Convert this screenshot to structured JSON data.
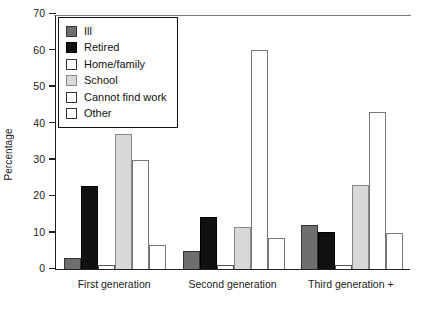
{
  "chart_data": {
    "type": "bar",
    "title": "",
    "xlabel": "",
    "ylabel": "Percentage",
    "ylim": [
      0,
      70
    ],
    "yticks": [
      0,
      10,
      20,
      30,
      40,
      50,
      60,
      70
    ],
    "ytick_labels": [
      "0",
      "10",
      "20",
      "30",
      "40",
      "50",
      "60",
      "70"
    ],
    "grid": false,
    "legend_position": "upper-left-inside",
    "categories": [
      "First generation",
      "Second generation",
      "Third generation +"
    ],
    "series": [
      {
        "name": "Ill",
        "color": "#6e6e6e",
        "edge": "#333333",
        "values": [
          3.0,
          5.0,
          12.2
        ]
      },
      {
        "name": "Retired",
        "color": "#111111",
        "edge": "#000000",
        "values": [
          22.8,
          14.2,
          10.2
        ]
      },
      {
        "name": "Home/family",
        "color": "#ffffff",
        "edge": "#555555",
        "values": [
          1.0,
          1.0,
          1.0
        ]
      },
      {
        "name": "School",
        "color": "#d8d8d8",
        "edge": "#888888",
        "values": [
          37.0,
          11.6,
          23.0
        ]
      },
      {
        "name": "Cannot find work",
        "color": "#ffffff",
        "edge": "#777777",
        "values": [
          30.0,
          60.0,
          43.0
        ]
      },
      {
        "name": "Other",
        "color": "#ffffff",
        "edge": "#777777",
        "values": [
          6.6,
          8.5,
          10.0
        ]
      }
    ]
  },
  "legend": {
    "items": [
      {
        "label": "Ill"
      },
      {
        "label": "Retired"
      },
      {
        "label": "Home/family"
      },
      {
        "label": "School"
      },
      {
        "label": "Cannot find work"
      },
      {
        "label": "Other"
      }
    ]
  },
  "axes": {
    "y_label": "Percentage"
  }
}
